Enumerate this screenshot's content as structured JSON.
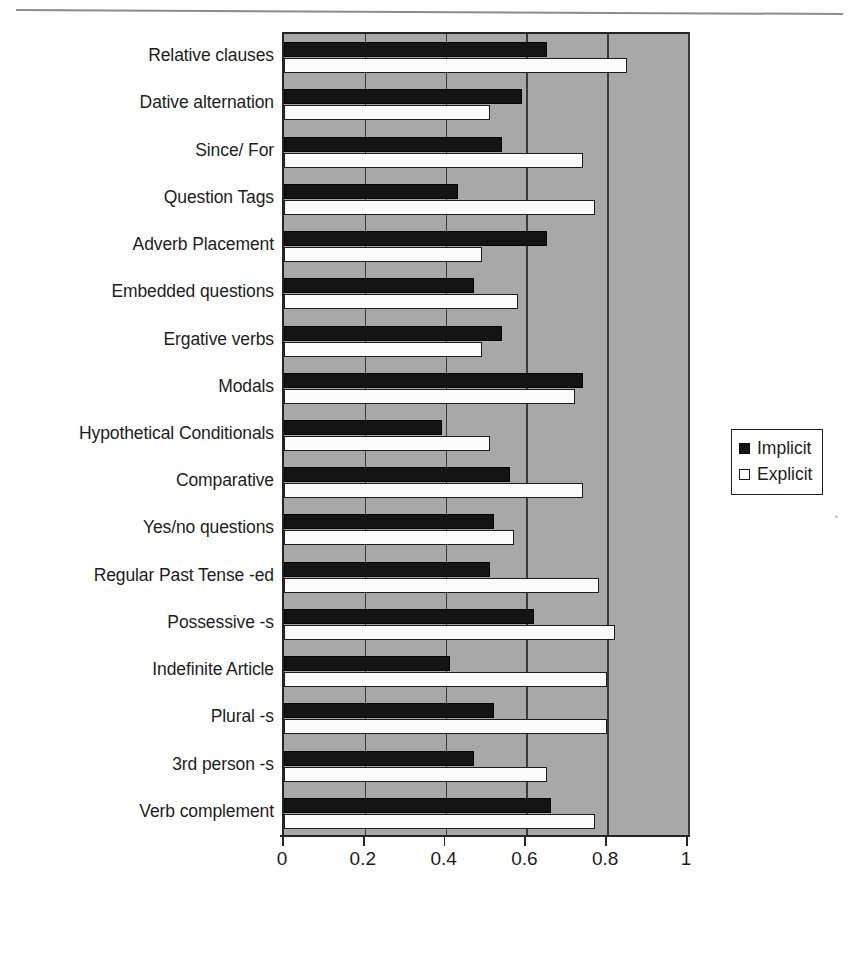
{
  "page": {
    "header_remnant": "",
    "scan_artifacts": [
      "page-rule",
      "scan-speck"
    ]
  },
  "legend": {
    "position": "right",
    "items": [
      {
        "label": "Implicit",
        "swatch": "filled-black-square",
        "color": "#141414"
      },
      {
        "label": "Explicit",
        "swatch": "open-white-square",
        "color": "#ffffff"
      }
    ]
  },
  "axis": {
    "x_ticks": [
      "0",
      "0.2",
      "0.4",
      "0.6",
      "0.8",
      "1"
    ],
    "x_tick_values": [
      0,
      0.2,
      0.4,
      0.6,
      0.8,
      1
    ]
  },
  "chart_data": {
    "type": "bar",
    "orientation": "horizontal",
    "title": "",
    "subtitle": "",
    "xlabel": "",
    "ylabel": "",
    "xlim": [
      0,
      1
    ],
    "xticks": [
      0,
      0.2,
      0.4,
      0.6,
      0.8,
      1
    ],
    "grid": true,
    "legend_position": "right",
    "plot_background": "#a8a8a8",
    "categories": [
      "Relative clauses",
      "Dative alternation",
      "Since/ For",
      "Question Tags",
      "Adverb Placement",
      "Embedded questions",
      "Ergative verbs",
      "Modals",
      "Hypothetical Conditionals",
      "Comparative",
      "Yes/no questions",
      "Regular Past Tense -ed",
      "Possessive -s",
      "Indefinite Article",
      "Plural -s",
      "3rd person -s",
      "Verb complement"
    ],
    "series": [
      {
        "name": "Implicit",
        "color": "#141414",
        "values": [
          0.65,
          0.59,
          0.54,
          0.43,
          0.65,
          0.47,
          0.54,
          0.74,
          0.39,
          0.56,
          0.52,
          0.51,
          0.62,
          0.41,
          0.52,
          0.47,
          0.66
        ]
      },
      {
        "name": "Explicit",
        "color": "#ffffff",
        "values": [
          0.85,
          0.51,
          0.74,
          0.77,
          0.49,
          0.58,
          0.49,
          0.72,
          0.51,
          0.74,
          0.57,
          0.78,
          0.82,
          0.8,
          0.8,
          0.65,
          0.77
        ]
      }
    ]
  }
}
